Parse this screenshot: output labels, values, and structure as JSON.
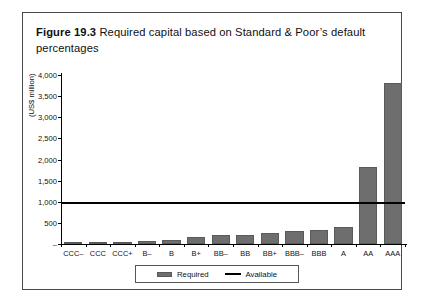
{
  "figure": {
    "label": "Figure 19.3",
    "caption": "Required capital based on Standard & Poor’s default percentages"
  },
  "colors": {
    "bar_fill": "#6e6e6e",
    "bar_stroke": "#5a5a5a",
    "line": "#000000",
    "frame": "#4a4a4a",
    "background": "#ffffff"
  },
  "legend": {
    "position": "bottom-center",
    "entries": [
      {
        "label": "Required",
        "marker": "bar-swatch",
        "color": "#6e6e6e"
      },
      {
        "label": "Available",
        "marker": "line-swatch",
        "color": "#000000"
      }
    ]
  },
  "chart_data": {
    "type": "bar",
    "title": "Required capital based on Standard & Poor’s default percentages",
    "xlabel": "",
    "ylabel": "(US$ million)",
    "ylim": [
      0,
      4000
    ],
    "grid": false,
    "categories": [
      "CCC–",
      "CCC",
      "CCC+",
      "B–",
      "B",
      "B+",
      "BB–",
      "BB",
      "BB+",
      "BBB–",
      "BBB",
      "A",
      "AA",
      "AAA"
    ],
    "ytick_labels": [
      "–",
      "500",
      "1,000",
      "1,500",
      "2,000",
      "2,500",
      "3,000",
      "3,500",
      "4,000"
    ],
    "ytick_values": [
      0,
      500,
      1000,
      1500,
      2000,
      2500,
      3000,
      3500,
      4000
    ],
    "series": [
      {
        "name": "Required",
        "type": "bar",
        "values": [
          5,
          10,
          30,
          80,
          95,
          160,
          210,
          215,
          250,
          300,
          330,
          400,
          1820,
          3820
        ]
      },
      {
        "name": "Available",
        "type": "line",
        "constant_value": 1000
      }
    ]
  }
}
